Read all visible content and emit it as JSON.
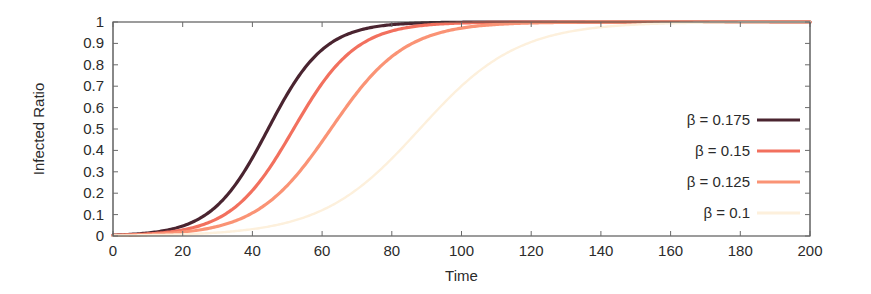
{
  "chart_data": {
    "type": "line",
    "title": "",
    "xlabel": "Time",
    "ylabel": "Infected Ratio",
    "xlim": [
      0,
      200
    ],
    "ylim": [
      0,
      1
    ],
    "xticks": [
      0,
      20,
      40,
      60,
      80,
      100,
      120,
      140,
      160,
      180,
      200
    ],
    "xtick_labels": [
      "0",
      "20",
      "40",
      "60",
      "80",
      "100",
      "120",
      "140",
      "160",
      "180",
      "200"
    ],
    "yticks": [
      0,
      0.1,
      0.2,
      0.3,
      0.4,
      0.5,
      0.6,
      0.7,
      0.8,
      0.9,
      1
    ],
    "ytick_labels": [
      "0",
      "0.1",
      "0.2",
      "0.3",
      "0.4",
      "0.5",
      "0.6",
      "0.7",
      "0.8",
      "0.9",
      "1"
    ],
    "grid": false,
    "legend_position": "right-outside",
    "series": [
      {
        "name": "β = 0.175",
        "color": "#4a2430",
        "linewidth": 3.2,
        "midpoint": 44.5,
        "steepness": 0.123,
        "x": [
          0,
          5,
          10,
          15,
          20,
          25,
          30,
          35,
          40,
          45,
          50,
          55,
          60,
          65,
          70,
          75,
          80,
          90,
          100,
          120,
          140,
          160,
          180,
          200
        ],
        "values": [
          0.003,
          0.006,
          0.011,
          0.019,
          0.035,
          0.062,
          0.107,
          0.178,
          0.281,
          0.415,
          0.561,
          0.697,
          0.804,
          0.879,
          0.927,
          0.957,
          0.975,
          0.992,
          0.998,
          1.0,
          1.0,
          1.0,
          1.0,
          1.0
        ]
      },
      {
        "name": "β = 0.15",
        "color": "#f2705e",
        "linewidth": 3.2,
        "midpoint": 51.8,
        "steepness": 0.111,
        "x": [
          0,
          5,
          10,
          15,
          20,
          25,
          30,
          35,
          40,
          45,
          50,
          55,
          60,
          65,
          70,
          75,
          80,
          90,
          100,
          120,
          140,
          160,
          180,
          200
        ],
        "values": [
          0.003,
          0.005,
          0.009,
          0.015,
          0.026,
          0.045,
          0.076,
          0.125,
          0.199,
          0.303,
          0.431,
          0.567,
          0.692,
          0.791,
          0.864,
          0.913,
          0.945,
          0.981,
          0.994,
          0.999,
          1.0,
          1.0,
          1.0,
          1.0
        ]
      },
      {
        "name": "β = 0.125",
        "color": "#fa9375",
        "linewidth": 3.2,
        "midpoint": 62.5,
        "steepness": 0.094,
        "x": [
          0,
          5,
          10,
          15,
          20,
          25,
          30,
          35,
          40,
          45,
          50,
          55,
          60,
          65,
          70,
          75,
          80,
          90,
          100,
          120,
          140,
          160,
          180,
          200
        ],
        "values": [
          0.003,
          0.005,
          0.008,
          0.013,
          0.021,
          0.033,
          0.052,
          0.081,
          0.125,
          0.188,
          0.273,
          0.378,
          0.494,
          0.609,
          0.71,
          0.793,
          0.855,
          0.932,
          0.97,
          0.994,
          0.999,
          1.0,
          1.0,
          1.0
        ]
      },
      {
        "name": "β = 0.1",
        "color": "#fdf0dc",
        "linewidth": 2.4,
        "midpoint": 88.0,
        "steepness": 0.071,
        "x": [
          0,
          5,
          10,
          15,
          20,
          25,
          30,
          35,
          40,
          45,
          50,
          55,
          60,
          65,
          70,
          75,
          80,
          90,
          100,
          110,
          120,
          140,
          160,
          180,
          200
        ],
        "values": [
          0.002,
          0.003,
          0.004,
          0.006,
          0.008,
          0.012,
          0.017,
          0.024,
          0.034,
          0.047,
          0.066,
          0.091,
          0.124,
          0.166,
          0.218,
          0.28,
          0.349,
          0.492,
          0.63,
          0.745,
          0.83,
          0.934,
          0.977,
          0.992,
          0.997
        ]
      }
    ]
  },
  "geometry": {
    "plot_left": 113,
    "plot_right": 810,
    "plot_top": 22,
    "plot_bottom": 236,
    "legend_label_right": 750,
    "legend_swatch_left": 757,
    "legend_swatch_right": 800,
    "legend_first_y": 120,
    "legend_row_step": 31
  }
}
